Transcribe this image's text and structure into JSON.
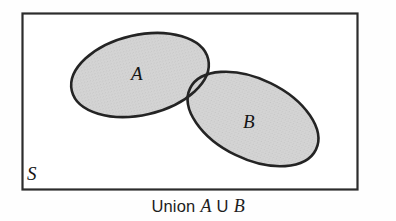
{
  "figure": {
    "type": "venn-diagram",
    "caption": {
      "prefix": "Union",
      "set_a": "A",
      "operator": "U",
      "set_b": "B",
      "full_text": "Union A U B"
    },
    "universal_set": {
      "label": "S",
      "box": {
        "x": 22,
        "y": 13,
        "width": 336,
        "height": 177
      },
      "border_color": "#2a2a2a",
      "fill_color": "#ffffff"
    },
    "sets": [
      {
        "name": "set-a",
        "label": "A",
        "cx": 140,
        "cy": 75,
        "rx": 70,
        "ry": 40,
        "rotation": -13,
        "fill_color": "#d2d2d2",
        "stroke_color": "#262626"
      },
      {
        "name": "set-b",
        "label": "B",
        "cx": 253,
        "cy": 119,
        "rx": 70,
        "ry": 40,
        "rotation": 26,
        "fill_color": "#d2d2d2",
        "stroke_color": "#262626"
      }
    ],
    "region_shaded": "union"
  }
}
